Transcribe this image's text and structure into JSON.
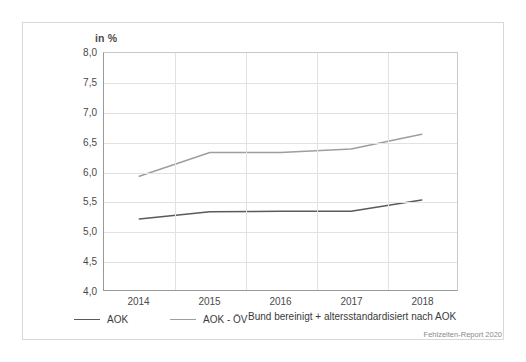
{
  "chart_data": {
    "type": "line",
    "title": "",
    "subtitle": "",
    "unit_label": "in %",
    "xlabel": "",
    "ylabel": "",
    "categories": [
      "2014",
      "2015",
      "2016",
      "2017",
      "2018"
    ],
    "x": [
      2014,
      2015,
      2016,
      2017,
      2018
    ],
    "ylim": [
      4.0,
      8.0
    ],
    "ytick_values": [
      8.0,
      7.5,
      7.0,
      6.5,
      6.0,
      5.5,
      5.0,
      4.5,
      4.0
    ],
    "ytick_labels": [
      "8,0",
      "7,5",
      "7,0",
      "6,5",
      "6,0",
      "5,5",
      "5,0",
      "4,5",
      "4,0"
    ],
    "grid": true,
    "legend_position": "bottom-left",
    "series": [
      {
        "name": "AOK",
        "color": "#5a5a5a",
        "values": [
          5.2,
          5.32,
          5.33,
          5.33,
          5.52
        ]
      },
      {
        "name": "AOK - ÖV",
        "color": "#9e9e9e",
        "values": [
          5.92,
          6.32,
          6.32,
          6.38,
          6.63
        ]
      }
    ],
    "annotations": [
      "Bund bereinigt + altersstandardisiert nach AOK"
    ]
  },
  "legend": {
    "items": [
      {
        "label": "AOK",
        "color": "#5a5a5a"
      },
      {
        "label": "AOK - ÖV",
        "color": "#9e9e9e"
      }
    ]
  },
  "footnote": "Bund bereinigt + altersstandardisiert nach AOK",
  "source": "Fehlzeiten-Report 2020"
}
